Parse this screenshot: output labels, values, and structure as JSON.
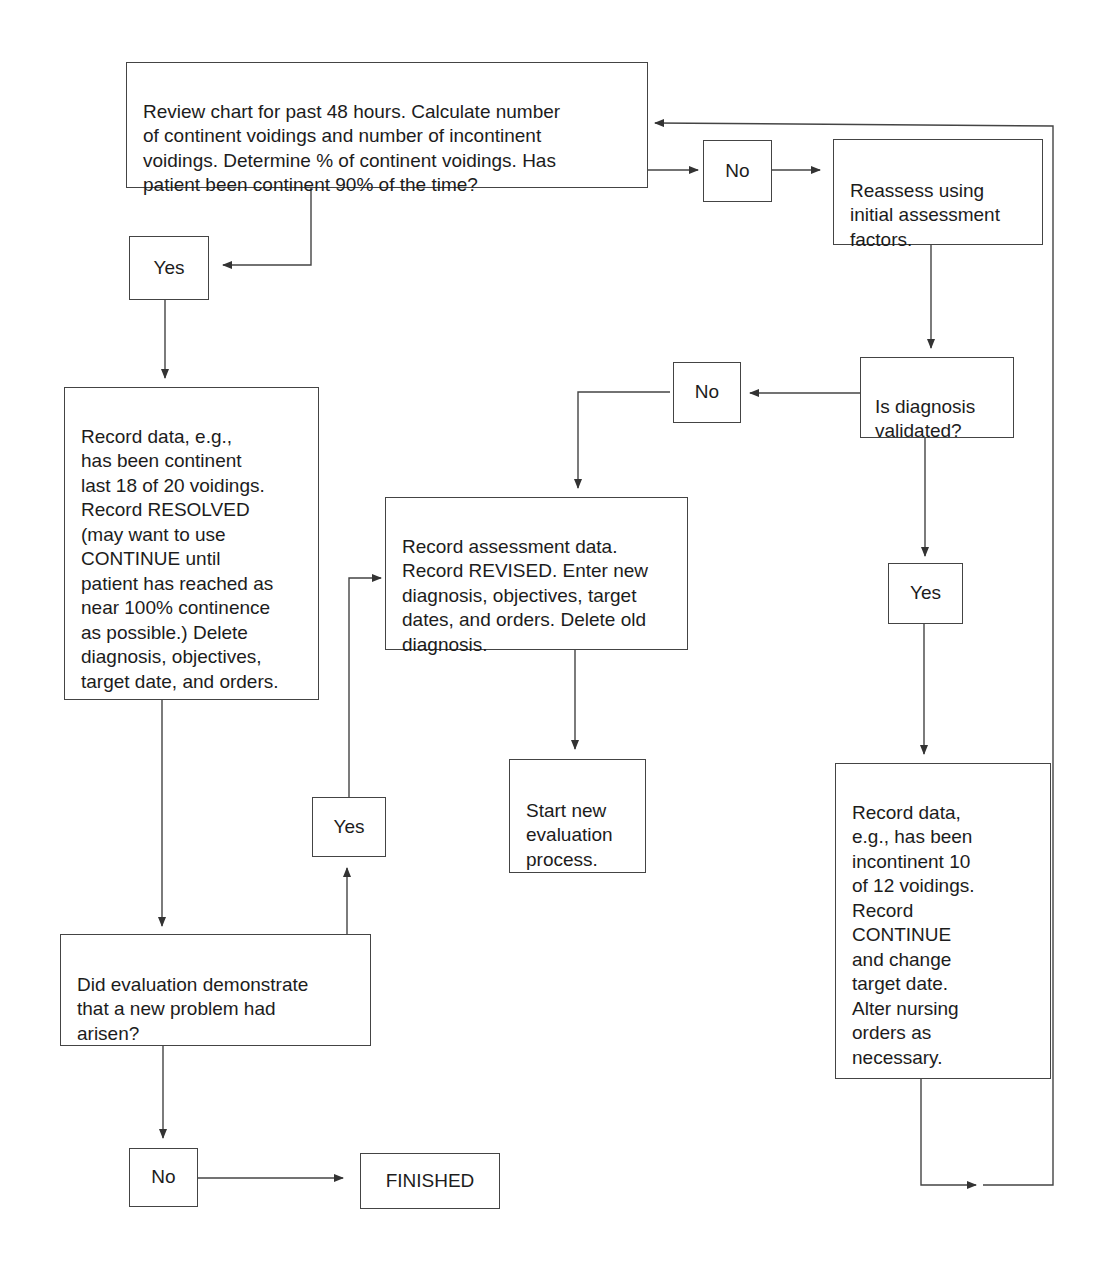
{
  "diagram": {
    "type": "flowchart",
    "nodes": {
      "review": {
        "text": "Review chart for past 48 hours. Calculate number\nof continent voidings and number of incontinent\nvoidings. Determine % of continent voidings. Has\npatient been continent 90% of the time?"
      },
      "no_top": {
        "text": "No"
      },
      "reassess": {
        "text": "Reassess using\ninitial assessment\nfactors."
      },
      "yes_left": {
        "text": "Yes"
      },
      "record_resolved": {
        "text": "Record data, e.g.,\nhas been continent\nlast 18 of 20 voidings.\nRecord RESOLVED\n(may want to use\nCONTINUE until\npatient has reached as\nnear 100% continence\nas possible.) Delete\ndiagnosis, objectives,\ntarget date, and orders."
      },
      "diagnosis_validated": {
        "text": "Is diagnosis\nvalidated?"
      },
      "no_mid": {
        "text": "No"
      },
      "record_revised": {
        "text": "Record assessment data.\nRecord REVISED. Enter new\ndiagnosis, objectives, target\ndates, and orders. Delete old\ndiagnosis."
      },
      "yes_right": {
        "text": "Yes"
      },
      "start_new": {
        "text": "Start new\nevaluation\nprocess."
      },
      "yes_mid": {
        "text": "Yes"
      },
      "record_continue": {
        "text": "Record data,\ne.g., has been\nincontinent 10\nof 12 voidings.\nRecord\nCONTINUE\nand change\ntarget date.\nAlter nursing\norders as\nnecessary."
      },
      "new_problem": {
        "text": "Did evaluation demonstrate\nthat a new problem had\narisen?"
      },
      "no_bottom": {
        "text": "No"
      },
      "finished": {
        "text": "FINISHED"
      }
    },
    "edges": [
      {
        "from": "review",
        "to": "no_top"
      },
      {
        "from": "no_top",
        "to": "reassess"
      },
      {
        "from": "review",
        "to": "yes_left"
      },
      {
        "from": "yes_left",
        "to": "record_resolved"
      },
      {
        "from": "reassess",
        "to": "diagnosis_validated"
      },
      {
        "from": "diagnosis_validated",
        "to": "no_mid"
      },
      {
        "from": "no_mid",
        "to": "record_revised"
      },
      {
        "from": "diagnosis_validated",
        "to": "yes_right"
      },
      {
        "from": "yes_right",
        "to": "record_continue"
      },
      {
        "from": "record_revised",
        "to": "start_new"
      },
      {
        "from": "record_resolved",
        "to": "new_problem"
      },
      {
        "from": "new_problem",
        "to": "yes_mid"
      },
      {
        "from": "yes_mid",
        "to": "record_revised"
      },
      {
        "from": "new_problem",
        "to": "no_bottom"
      },
      {
        "from": "no_bottom",
        "to": "finished"
      },
      {
        "from": "record_continue",
        "to": "review"
      }
    ],
    "line_color": "#444444"
  }
}
